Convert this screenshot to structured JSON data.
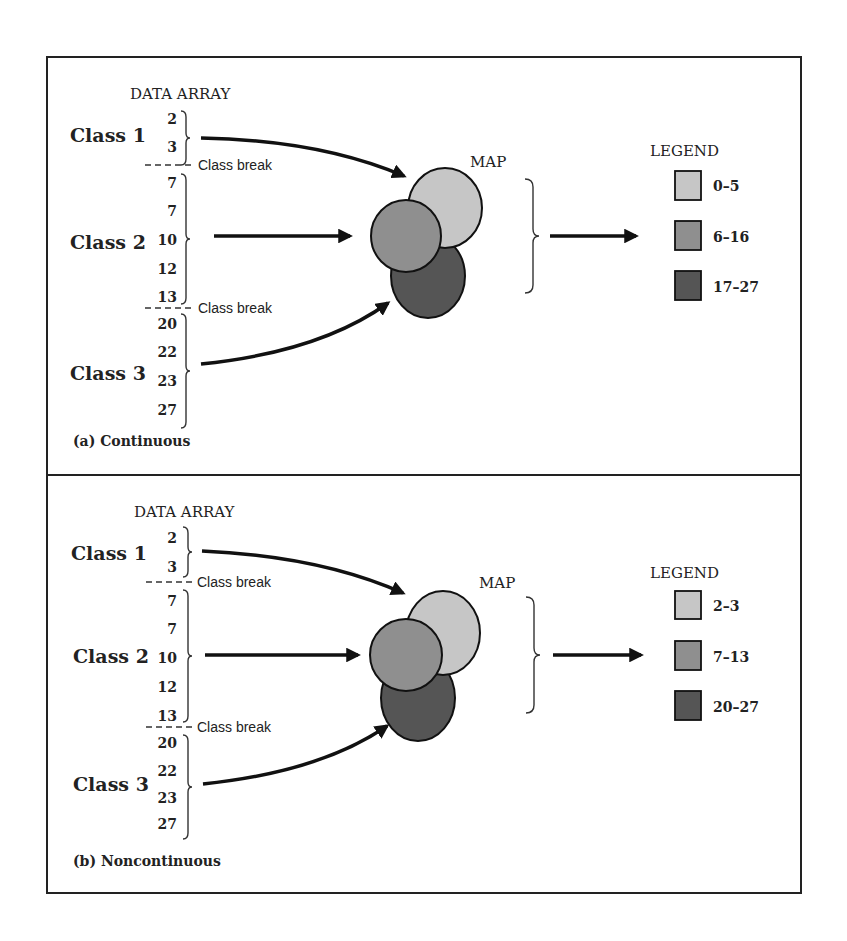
{
  "colors": {
    "light": "#c6c6c6",
    "medium": "#8f8f8f",
    "dark": "#555555",
    "ink": "#222222"
  },
  "panels": [
    {
      "id": "a",
      "caption": "(a) Continuous",
      "data_array_title": "DATA ARRAY",
      "map_title": "MAP",
      "legend_title": "LEGEND",
      "class_break_label": "Class break",
      "classes": [
        {
          "label": "Class 1",
          "values": [
            "2",
            "3"
          ]
        },
        {
          "label": "Class 2",
          "values": [
            "7",
            "7",
            "10",
            "12",
            "13"
          ]
        },
        {
          "label": "Class 3",
          "values": [
            "20",
            "22",
            "23",
            "27"
          ]
        }
      ],
      "legend": [
        {
          "range": "0–5",
          "shade": "light"
        },
        {
          "range": "6–16",
          "shade": "medium"
        },
        {
          "range": "17–27",
          "shade": "dark"
        }
      ]
    },
    {
      "id": "b",
      "caption": "(b) Noncontinuous",
      "data_array_title": "DATA ARRAY",
      "map_title": "MAP",
      "legend_title": "LEGEND",
      "class_break_label": "Class break",
      "classes": [
        {
          "label": "Class 1",
          "values": [
            "2",
            "3"
          ]
        },
        {
          "label": "Class 2",
          "values": [
            "7",
            "7",
            "10",
            "12",
            "13"
          ]
        },
        {
          "label": "Class 3",
          "values": [
            "20",
            "22",
            "23",
            "27"
          ]
        }
      ],
      "legend": [
        {
          "range": "2–3",
          "shade": "light"
        },
        {
          "range": "7–13",
          "shade": "medium"
        },
        {
          "range": "20–27",
          "shade": "dark"
        }
      ]
    }
  ]
}
